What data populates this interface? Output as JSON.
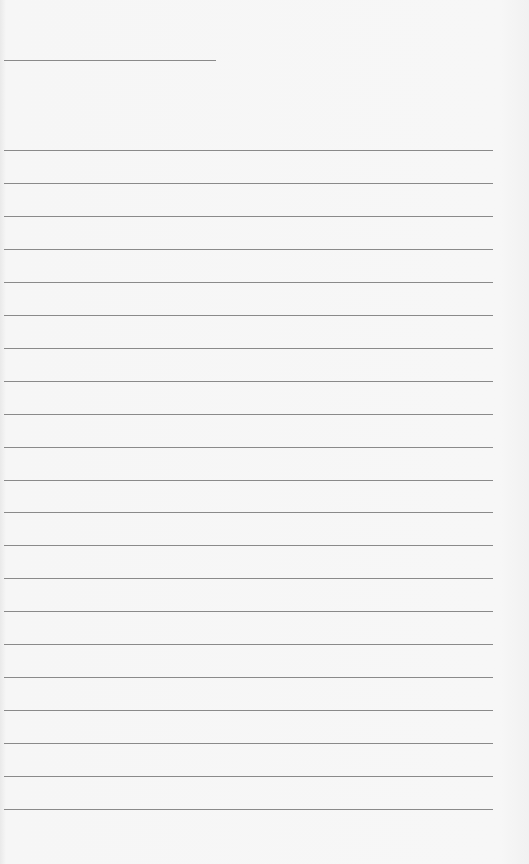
{
  "page": {
    "type": "lined-paper",
    "background_color": "#f6f6f6",
    "line_color": "#8a8a8a",
    "header_line": {
      "y": 60,
      "x_start": 4,
      "x_end": 216
    },
    "ruled_lines": {
      "count": 21,
      "first_y": 150,
      "spacing": 32.95,
      "x_start": 4,
      "x_end": 493
    }
  }
}
